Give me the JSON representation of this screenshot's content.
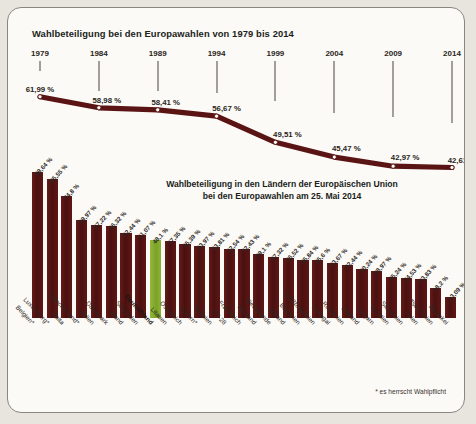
{
  "frame": {
    "bg_color": "#fbfaf6",
    "border_color": "#8a8580",
    "page_bg": "#e8e5de"
  },
  "colors": {
    "bar": "#4e1212",
    "bar_highlight": "#86ab2f",
    "line": "#5a1414",
    "text": "#231f1c"
  },
  "line_section": {
    "title": "Wahlbeteiligung bei den Europawahlen von 1979 bis 2014"
  },
  "bar_section": {
    "title_line1": "Wahlbeteiligung in den Ländern der Europäischen Union",
    "title_line2": "bei den Europawahlen am 25. Mai 2014",
    "footnote": "* es herrscht Wahlpflicht"
  },
  "chart_data": [
    {
      "type": "line",
      "title": "Wahlbeteiligung bei den Europawahlen von 1979 bis 2014",
      "xlabel": "",
      "ylabel": "Wahlbeteiligung",
      "x": [
        "1979",
        "1984",
        "1989",
        "1994",
        "1999",
        "2004",
        "2009",
        "2014"
      ],
      "values": [
        61.99,
        58.98,
        58.41,
        56.67,
        49.51,
        45.47,
        42.97,
        42.61
      ],
      "value_labels": [
        "61,99 %",
        "58,98 %",
        "58,41 %",
        "56,67 %",
        "49,51 %",
        "45,47 %",
        "42,97 %",
        "42,61 %"
      ],
      "ylim": [
        40,
        64
      ],
      "grid": false,
      "legend": "none",
      "marker": "circle"
    },
    {
      "type": "bar",
      "title": "Wahlbeteiligung in den Ländern der Europäischen Union bei den Europawahlen am 25. Mai 2014",
      "xlabel": "",
      "ylabel": "Wahlbeteiligung",
      "ylim": [
        0,
        90
      ],
      "grid": false,
      "legend": "none",
      "highlight_category": "Deutschland",
      "categories": [
        "Belgien*",
        "Luxemburg*",
        "Malta",
        "Griechenland*",
        "Italien",
        "Dänemark",
        "Irland",
        "Schweden",
        "Deutschland",
        "Litauen",
        "Österreich",
        "Zypern*",
        "Spanien",
        "EU-28",
        "Frankreich",
        "Finnland",
        "Niederlande",
        "Estland",
        "Bulgarien",
        "Großbritannien",
        "Portugal",
        "Rumänien",
        "Lettland",
        "Ungarn",
        "Kroatien",
        "Slowenien",
        "Polen",
        "Tschechien",
        "Slowakei"
      ],
      "values": [
        89.64,
        85.55,
        74.8,
        59.97,
        57.22,
        56.32,
        52.44,
        51.07,
        48.1,
        47.35,
        45.39,
        43.97,
        43.81,
        42.54,
        42.43,
        39.1,
        37.32,
        36.52,
        35.84,
        35.6,
        33.67,
        32.44,
        30.24,
        28.97,
        25.24,
        24.53,
        23.83,
        18.2,
        13.09
      ],
      "value_labels": [
        "89,64 %",
        "85,55 %",
        "74,8 %",
        "59,97 %",
        "57,22 %",
        "56,32 %",
        "52,44 %",
        "51,07 %",
        "48,1 %",
        "47,35 %",
        "45,39 %",
        "43,97 %",
        "43,81 %",
        "42,54 %",
        "42,43 %",
        "39,1 %",
        "37,32 %",
        "36,52 %",
        "35,84 %",
        "35,6 %",
        "33,67 %",
        "32,44 %",
        "30,24 %",
        "28,97 %",
        "25,24 %",
        "24,53 %",
        "23,83 %",
        "18,2 %",
        "13,09 %"
      ]
    }
  ]
}
